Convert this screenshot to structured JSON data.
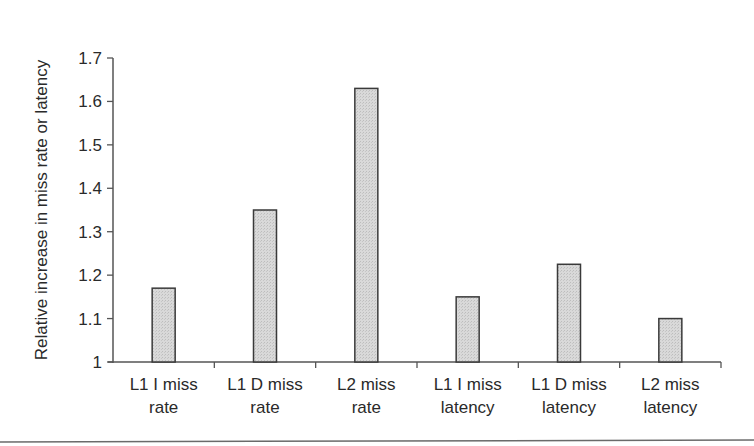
{
  "chart_data": {
    "type": "bar",
    "title": "",
    "xlabel": "",
    "ylabel": "Relative increase in miss rate or latency",
    "categories": [
      [
        "L1 I miss",
        "rate"
      ],
      [
        "L1 D miss",
        "rate"
      ],
      [
        "L2 miss",
        "rate"
      ],
      [
        "L1 I miss",
        "latency"
      ],
      [
        "L1 D miss",
        "latency"
      ],
      [
        "L2 miss",
        "latency"
      ]
    ],
    "category_labels": [
      "L1 I miss rate",
      "L1 D miss rate",
      "L2 miss rate",
      "L1 I miss latency",
      "L1 D miss latency",
      "L2 miss latency"
    ],
    "values": [
      1.17,
      1.35,
      1.63,
      1.15,
      1.225,
      1.1
    ],
    "ylim": [
      1,
      1.7
    ],
    "yticks": [
      1,
      1.1,
      1.2,
      1.3,
      1.4,
      1.5,
      1.6,
      1.7
    ],
    "ytick_labels": [
      "1",
      "1.1",
      "1.2",
      "1.3",
      "1.4",
      "1.5",
      "1.6",
      "1.7"
    ],
    "grid": false,
    "legend": null,
    "bar_fill": "#d4d4d4",
    "bar_stroke": "#3a3a3a",
    "axis_color": "#555555"
  }
}
